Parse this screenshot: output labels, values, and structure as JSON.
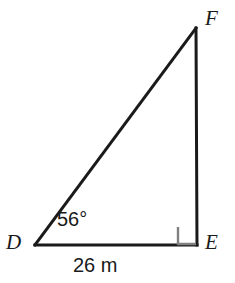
{
  "figure": {
    "kind": "right-triangle-diagram",
    "background_color": "#ffffff",
    "line_color": "#1a1a1a",
    "right_angle_color": "#808080",
    "vertices": {
      "d": {
        "label": "D",
        "x": 35,
        "y": 245
      },
      "e": {
        "label": "E",
        "x": 197,
        "y": 245
      },
      "f": {
        "label": "F",
        "x": 196,
        "y": 27
      }
    },
    "angles": [
      {
        "at": "D",
        "label": "56°",
        "value": 56,
        "unit": "degrees"
      },
      {
        "at": "E",
        "label": "",
        "value": 90,
        "unit": "degrees",
        "marker": "right-angle-square"
      }
    ],
    "sides": [
      {
        "from": "D",
        "to": "E",
        "label": "26 m",
        "value": 26,
        "unit": "m"
      },
      {
        "from": "E",
        "to": "F",
        "label": ""
      },
      {
        "from": "D",
        "to": "F",
        "label": ""
      }
    ]
  }
}
